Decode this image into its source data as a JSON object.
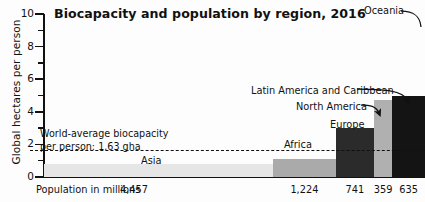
{
  "chart_data": {
    "type": "bar",
    "title": "Biocapacity and population by region, 2016",
    "subtitle": "",
    "xlabel": "Population in millions",
    "ylabel": "Global hectares per person",
    "ylim": [
      0,
      10
    ],
    "yticks": [
      0,
      2,
      4,
      6,
      8,
      10
    ],
    "yticks_minor": [
      1,
      3,
      5,
      7,
      9
    ],
    "grid": false,
    "legend": "none",
    "note": "Marimekko-style chart: bar width is proportional to population, bar height is biocapacity in global hectares per person.",
    "categories": [
      "Asia",
      "Africa",
      "Europe",
      "North America",
      "Oceania"
    ],
    "values": [
      0.8,
      1.1,
      3.0,
      4.7,
      4.95
    ],
    "widths": [
      4457,
      1224,
      741,
      359,
      635
    ],
    "width_unit": "millions of people",
    "series": [
      {
        "name": "Biocapacity per person (gha)",
        "values": [
          0.8,
          1.1,
          3.0,
          4.7,
          4.95
        ]
      },
      {
        "name": "Population (millions)",
        "values": [
          4457,
          1224,
          741,
          359,
          635
        ]
      }
    ],
    "bar_colors": [
      "#e6e6e6",
      "#aaaaaa",
      "#2b2b2b",
      "#b0b0b0",
      "#141414"
    ],
    "population_labels": [
      "4,457",
      "1,224",
      "741",
      "359",
      "635"
    ],
    "reference_line": {
      "label_line1": "World-average biocapacity",
      "label_line2": "per person: 1.63 gha",
      "value": 1.63,
      "style": "dashed"
    },
    "annotations": [
      {
        "text": "Asia",
        "target": "Asia"
      },
      {
        "text": "Africa",
        "target": "Africa"
      },
      {
        "text": "Europe",
        "target": "Europe"
      },
      {
        "text": "North America",
        "target": "North America"
      },
      {
        "text": "Latin America and Caribbean",
        "target": "Latin America and Caribbean"
      },
      {
        "text": "Oceania",
        "target": "Oceania"
      }
    ]
  },
  "chart": {
    "title": "Biocapacity and population by region, 2016",
    "ylabel": "Global hectares per person",
    "xlabel": "Population in millions",
    "yticks": {
      "t10": "10",
      "t8": "8",
      "t6": "6",
      "t4": "4",
      "t2": "2",
      "t0": "0"
    },
    "refline": {
      "line1": "World-average biocapacity",
      "line2": "per person: 1.63 gha"
    },
    "labels": {
      "asia": "Asia",
      "africa": "Africa",
      "europe": "Europe",
      "north_america": "North America",
      "latin_america": "Latin America and Caribbean",
      "oceania": "Oceania"
    },
    "populations": {
      "asia": "4,457",
      "africa": "1,224",
      "europe": "741",
      "north_america": "359",
      "oceania": "635"
    },
    "colors": {
      "asia": "#e6e6e6",
      "africa": "#aaaaaa",
      "europe": "#2b2b2b",
      "north_america": "#b0b0b0",
      "oceania": "#141414",
      "axis": "#111111",
      "text": "#111111"
    }
  }
}
